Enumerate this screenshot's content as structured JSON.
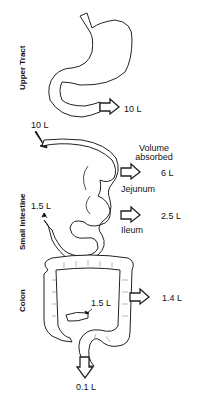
{
  "sections": {
    "upper_tract": "Upper Tract",
    "small_intestine": "Small Intestine",
    "colon": "Colon"
  },
  "header": {
    "volume_absorbed_line1": "Volume",
    "volume_absorbed_line2": "absorbed"
  },
  "upper_tract": {
    "output_volume": "10 L"
  },
  "small_intestine": {
    "input_volume": "10 L",
    "jejunum_label": "Jejunum",
    "jejunum_absorbed": "6 L",
    "ileum_label": "Ileum",
    "ileum_absorbed": "2.5 L",
    "output_volume": "1.5 L"
  },
  "colon": {
    "input_volume": "1.5 L",
    "absorbed": "1.4 L",
    "output_volume": "0.1 L"
  }
}
